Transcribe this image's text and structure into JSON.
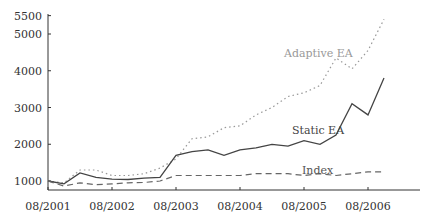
{
  "chart_data": {
    "type": "line",
    "title": "",
    "xlabel": "",
    "ylabel": "",
    "ylim": [
      800,
      5500
    ],
    "grid": false,
    "legend_position": "inline annotations",
    "x_tick_labels": [
      "08/2001",
      "08/2002",
      "08/2003",
      "08/2004",
      "08/2005",
      "08/2006"
    ],
    "y_tick_labels": [
      "1000",
      "2000",
      "3000",
      "4000",
      "5000",
      "5500"
    ],
    "x": [
      "08/2001",
      "11/2001",
      "02/2002",
      "05/2002",
      "08/2002",
      "11/2002",
      "02/2003",
      "05/2003",
      "08/2003",
      "11/2003",
      "02/2004",
      "05/2004",
      "08/2004",
      "11/2004",
      "02/2005",
      "05/2005",
      "08/2005",
      "11/2005",
      "02/2006",
      "05/2006",
      "08/2006",
      "11/2006"
    ],
    "series": [
      {
        "name": "Adaptive EA",
        "style": "dotted",
        "color": "#999999",
        "values": [
          1000,
          950,
          1300,
          1300,
          1150,
          1150,
          1200,
          1350,
          1600,
          2150,
          2200,
          2450,
          2500,
          2800,
          3000,
          3300,
          3400,
          3600,
          4350,
          4050,
          4550,
          5400
        ]
      },
      {
        "name": "Static EA",
        "style": "solid",
        "color": "#444444",
        "values": [
          1000,
          920,
          1220,
          1100,
          1050,
          1040,
          1080,
          1100,
          1700,
          1800,
          1850,
          1700,
          1850,
          1900,
          2000,
          1950,
          2100,
          2000,
          2250,
          3100,
          2800,
          3800
        ]
      },
      {
        "name": "Index",
        "style": "dashed",
        "color": "#666666",
        "values": [
          1000,
          860,
          950,
          900,
          920,
          950,
          960,
          1000,
          1150,
          1150,
          1150,
          1150,
          1150,
          1200,
          1200,
          1200,
          1150,
          1200,
          1150,
          1200,
          1250,
          1250
        ]
      }
    ],
    "annotations": [
      {
        "text": "Adaptive EA",
        "near": "Adaptive EA"
      },
      {
        "text": "Static EA",
        "near": "Static EA"
      },
      {
        "text": "Index",
        "near": "Index"
      }
    ]
  }
}
